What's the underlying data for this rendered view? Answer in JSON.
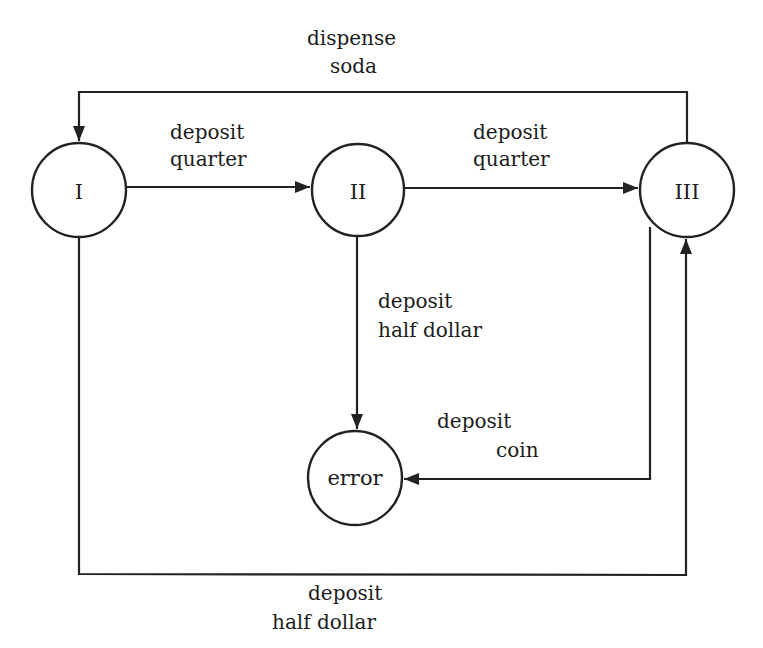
{
  "diagram": {
    "type": "state-machine",
    "title": "",
    "nodes": [
      {
        "id": "I",
        "label": "I",
        "cx": 79,
        "cy": 190,
        "r": 47
      },
      {
        "id": "II",
        "label": "II",
        "cx": 358,
        "cy": 190,
        "r": 46
      },
      {
        "id": "III",
        "label": "III",
        "cx": 687,
        "cy": 190,
        "r": 47
      },
      {
        "id": "error",
        "label": "error",
        "cx": 355,
        "cy": 478,
        "r": 47
      }
    ],
    "edges": [
      {
        "from": "III",
        "to": "I",
        "label_line1": "dispense",
        "label_line2": "soda"
      },
      {
        "from": "I",
        "to": "II",
        "label_line1": "deposit",
        "label_line2": "quarter"
      },
      {
        "from": "II",
        "to": "III",
        "label_line1": "deposit",
        "label_line2": "quarter"
      },
      {
        "from": "II",
        "to": "error",
        "label_line1": "deposit",
        "label_line2": "half dollar"
      },
      {
        "from": "III",
        "to": "error",
        "label_line1": "deposit",
        "label_line2": "coin"
      },
      {
        "from": "I",
        "to": "III",
        "label_line1": "deposit",
        "label_line2": "half dollar"
      }
    ]
  }
}
